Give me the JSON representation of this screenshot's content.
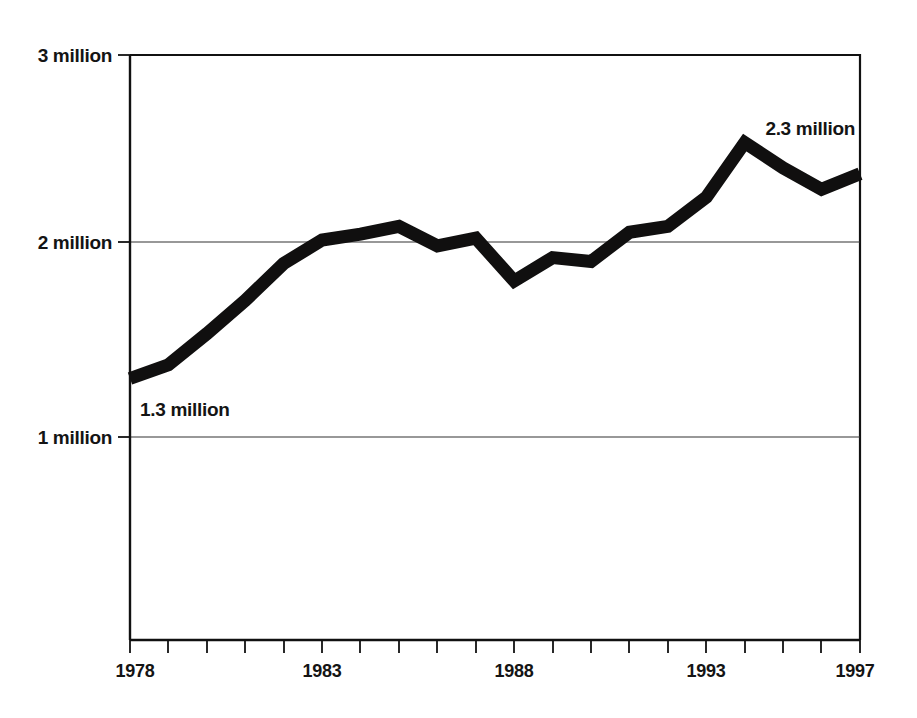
{
  "chart_data": {
    "type": "line",
    "title": "",
    "subtitle": "",
    "xlabel": "",
    "ylabel": "",
    "grid": true,
    "legend": "none",
    "xlim": [
      1978,
      1997
    ],
    "ylim": [
      0,
      3000000
    ],
    "x": [
      1978,
      1979,
      1980,
      1981,
      1982,
      1983,
      1984,
      1985,
      1986,
      1987,
      1988,
      1989,
      1990,
      1991,
      1992,
      1993,
      1994,
      1995,
      1996,
      1997
    ],
    "values": [
      1300000,
      1370000,
      1530000,
      1700000,
      1890000,
      2010000,
      2040000,
      2080000,
      1980000,
      2020000,
      1800000,
      1920000,
      1900000,
      2050000,
      2080000,
      2230000,
      2510000,
      2380000,
      2270000,
      2350000
    ],
    "series": [
      {
        "name": "value",
        "values": [
          1300000,
          1370000,
          1530000,
          1700000,
          1890000,
          2010000,
          2040000,
          2080000,
          1980000,
          2020000,
          1800000,
          1920000,
          1900000,
          2050000,
          2080000,
          2230000,
          2510000,
          2380000,
          2270000,
          2350000
        ]
      }
    ],
    "y_tick_values": [
      1000000,
      2000000,
      3000000
    ],
    "y_tick_labels": [
      "1 million",
      "2 million",
      "3 million"
    ],
    "x_tick_values": [
      1978,
      1983,
      1988,
      1993,
      1997
    ],
    "x_tick_labels": [
      "1978",
      "1983",
      "1988",
      "1993",
      "1997"
    ],
    "x_minor_ticks": [
      1978,
      1979,
      1980,
      1981,
      1982,
      1983,
      1984,
      1985,
      1986,
      1987,
      1988,
      1989,
      1990,
      1991,
      1992,
      1993,
      1994,
      1995,
      1996,
      1997
    ],
    "annotations": [
      {
        "text": "1.3 million",
        "x": 1978,
        "y": 1300000,
        "position": "below-right"
      },
      {
        "text": "2.3 million",
        "x": 1997,
        "y": 2350000,
        "position": "above-left"
      }
    ],
    "colors": {
      "line": "#100f0f",
      "grid": "#333333",
      "axis": "#111111",
      "text": "#141414",
      "background": "#ffffff"
    }
  },
  "axis": {
    "y_labels": {
      "three_million": "3 million",
      "two_million": "2 million",
      "one_million": "1 million"
    },
    "x_labels": {
      "start": "1978",
      "mid1": "1983",
      "mid2": "1988",
      "mid3": "1993",
      "end": "1997"
    }
  },
  "annotations": {
    "start_value": "1.3 million",
    "end_value": "2.3 million"
  }
}
